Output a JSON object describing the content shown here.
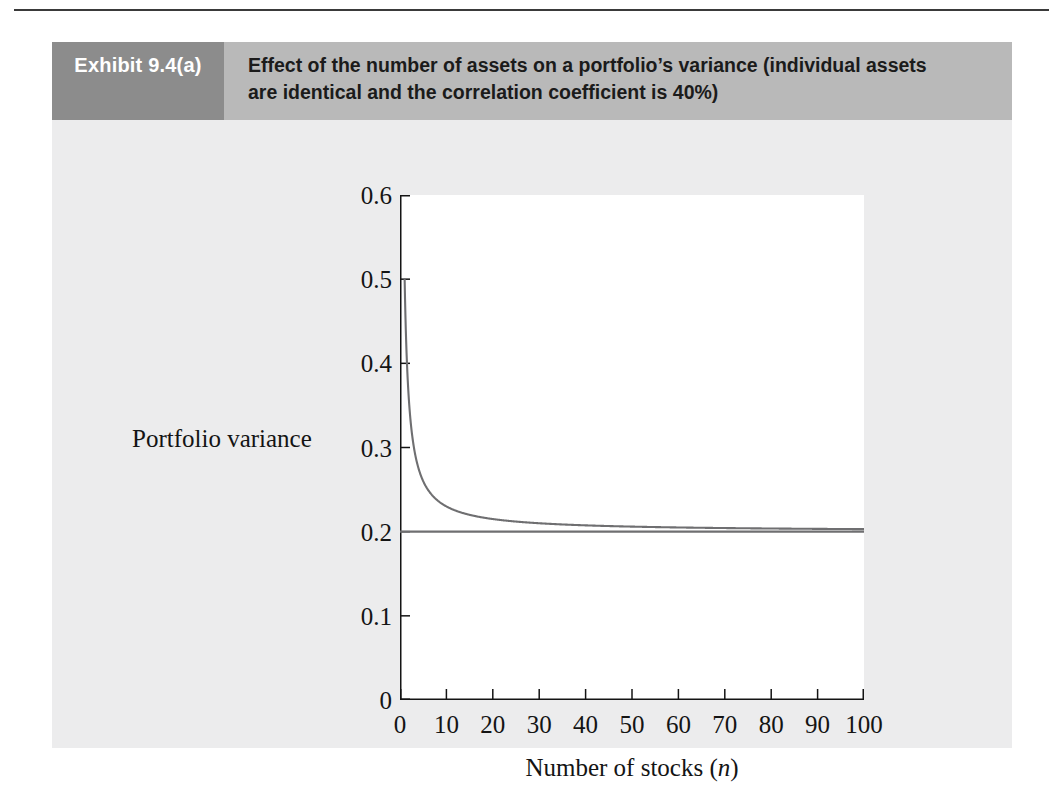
{
  "page": {
    "background": "#ffffff",
    "panel_background": "#ececed",
    "header_band_color": "#b9b9b9",
    "tag_color": "#8c8c8c",
    "ink_color": "#141414",
    "curve_color": "#6f6f71"
  },
  "exhibit": {
    "tag": "Exhibit 9.4(a)",
    "caption_line1": "Effect of the number of assets on a portfolio’s variance (individual assets",
    "caption_line2": "are identical and the correlation coefficient is 40%)"
  },
  "chart_data": {
    "type": "line",
    "title": "Effect of the number of assets on a portfolio’s variance (individual assets are identical and the correlation coefficient is 40%)",
    "xlabel": "Number of stocks (n)",
    "xlabel_plain": "Number of stocks",
    "xlabel_italic_symbol": "n",
    "ylabel": "Portfolio variance",
    "xlim": [
      0,
      100
    ],
    "ylim": [
      0,
      0.6
    ],
    "xticks": [
      0,
      10,
      20,
      30,
      40,
      50,
      60,
      70,
      80,
      90,
      100
    ],
    "xtick_labels": [
      "0",
      "10",
      "20",
      "30",
      "40",
      "50",
      "60",
      "70",
      "80",
      "90",
      "100"
    ],
    "yticks": [
      0,
      0.1,
      0.2,
      0.3,
      0.4,
      0.5,
      0.6
    ],
    "ytick_labels": [
      "0",
      "0.1",
      "0.2",
      "0.3",
      "0.4",
      "0.5",
      "0.6"
    ],
    "grid": false,
    "legend": "none",
    "series": [
      {
        "name": "Portfolio variance",
        "formula": "0.5/n + 0.2*(n-1)/n",
        "color": "#6f6f71",
        "x": [
          1,
          2,
          3,
          4,
          5,
          6,
          7,
          8,
          9,
          10,
          12,
          14,
          16,
          18,
          20,
          25,
          30,
          35,
          40,
          45,
          50,
          60,
          70,
          80,
          90,
          100
        ],
        "y": [
          0.5,
          0.35,
          0.3,
          0.275,
          0.26,
          0.25,
          0.243,
          0.238,
          0.233,
          0.23,
          0.225,
          0.221,
          0.219,
          0.217,
          0.215,
          0.212,
          0.21,
          0.209,
          0.208,
          0.207,
          0.206,
          0.205,
          0.204,
          0.204,
          0.203,
          0.203
        ]
      },
      {
        "name": "Systematic variance asymptote",
        "formula": "0.2",
        "color": "#6f6f71",
        "x": [
          0,
          100
        ],
        "y": [
          0.2,
          0.2
        ]
      }
    ],
    "annotations": [
      {
        "text": "asymptote at 0.2",
        "value": 0.2
      }
    ]
  },
  "ghost_text": {
    "block_a": "",
    "block_b": ""
  }
}
